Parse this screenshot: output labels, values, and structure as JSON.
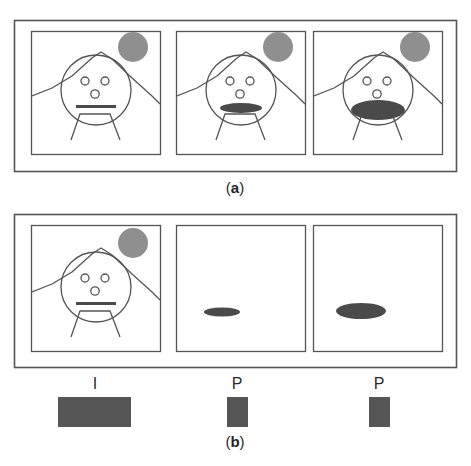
{
  "figure": {
    "title_absent": true,
    "background_color": "#ffffff",
    "line_color": "#555555",
    "sun_color": "#8f8f8f",
    "mouth_color": "#4a4a4a",
    "bar_color": "#555555",
    "panels_per_row": 3,
    "subfigures": [
      {
        "id": "a",
        "caption_open": "(",
        "caption_letter": "a",
        "caption_close": ")",
        "caption_full": "(a)",
        "description": "Three original video frames of a face with mouth progressively opening",
        "frames": [
          {
            "index": 1,
            "name": "frame-1",
            "content": "scene-face-closed-mouth",
            "mouth_state": "closed-line",
            "elements": [
              "mountain",
              "sun",
              "head",
              "eye-left",
              "eye-right",
              "nose",
              "mouth",
              "neck",
              "shoulders"
            ]
          },
          {
            "index": 2,
            "name": "frame-2",
            "content": "scene-face-small-open-mouth",
            "mouth_state": "small-open-ellipse",
            "elements": [
              "mountain",
              "sun",
              "head",
              "eye-left",
              "eye-right",
              "nose",
              "mouth",
              "neck",
              "shoulders"
            ]
          },
          {
            "index": 3,
            "name": "frame-3",
            "content": "scene-face-wide-open-mouth",
            "mouth_state": "wide-open-ellipse",
            "elements": [
              "mountain",
              "sun",
              "head",
              "eye-left",
              "eye-right",
              "nose",
              "mouth",
              "neck",
              "shoulders"
            ]
          }
        ]
      },
      {
        "id": "b",
        "caption_open": "(",
        "caption_letter": "b",
        "caption_close": ")",
        "caption_full": "(b)",
        "description": "Encoded representation: one intra-coded frame followed by two predicted difference frames",
        "frames": [
          {
            "index": 1,
            "name": "frame-1",
            "content": "scene-face-closed-mouth",
            "mouth_state": "closed-line",
            "frame_type_label": "I",
            "bar_width_px": 73,
            "elements": [
              "mountain",
              "sun",
              "head",
              "eye-left",
              "eye-right",
              "nose",
              "mouth",
              "neck",
              "shoulders"
            ]
          },
          {
            "index": 2,
            "name": "frame-2",
            "content": "residual-small-ellipse",
            "mouth_state": "residual-small",
            "frame_type_label": "P",
            "bar_width_px": 21,
            "elements": [
              "residual-ellipse"
            ]
          },
          {
            "index": 3,
            "name": "frame-3",
            "content": "residual-large-ellipse",
            "mouth_state": "residual-large",
            "frame_type_label": "P",
            "bar_width_px": 21,
            "elements": [
              "residual-ellipse"
            ]
          }
        ]
      }
    ]
  }
}
